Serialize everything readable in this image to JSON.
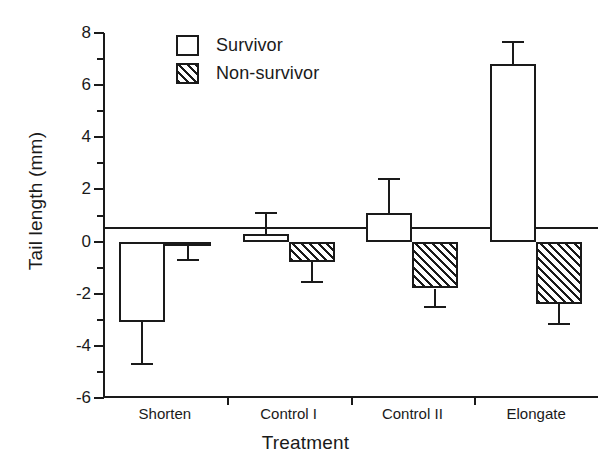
{
  "chart_data": {
    "type": "bar",
    "title": "",
    "xlabel": "Treatment",
    "ylabel": "Tail length (mm)",
    "categories": [
      "Shorten",
      "Control I",
      "Control II",
      "Elongate"
    ],
    "ylim": [
      -6,
      8
    ],
    "ytick_major": [
      8,
      6,
      4,
      2,
      0,
      -2,
      -4,
      -6
    ],
    "ytick_minor": [
      7,
      5,
      3,
      1,
      -1,
      -3,
      -5
    ],
    "grid": false,
    "legend_position": "top-left",
    "series": [
      {
        "name": "Survivor",
        "fill": "open",
        "values": [
          -3.1,
          0.3,
          1.1,
          6.8
        ],
        "errors": [
          1.6,
          0.8,
          1.3,
          0.85
        ]
      },
      {
        "name": "Non-survivor",
        "fill": "hatched",
        "values": [
          -0.05,
          -0.8,
          -1.8,
          -2.4
        ],
        "errors": [
          0.65,
          0.75,
          0.7,
          0.75
        ]
      }
    ]
  },
  "axis": {
    "y_tick_labels": [
      "8",
      "6",
      "4",
      "2",
      "0",
      "-2",
      "-4",
      "-6"
    ],
    "y_title": "Tail length (mm)",
    "x_title": "Treatment",
    "x_tick_labels": [
      "Shorten",
      "Control I",
      "Control II",
      "Elongate"
    ]
  },
  "legend": {
    "items": [
      {
        "label": "Survivor"
      },
      {
        "label": "Non-survivor"
      }
    ]
  },
  "colors": {
    "ink": "#1a1a1a",
    "background": "#ffffff"
  }
}
